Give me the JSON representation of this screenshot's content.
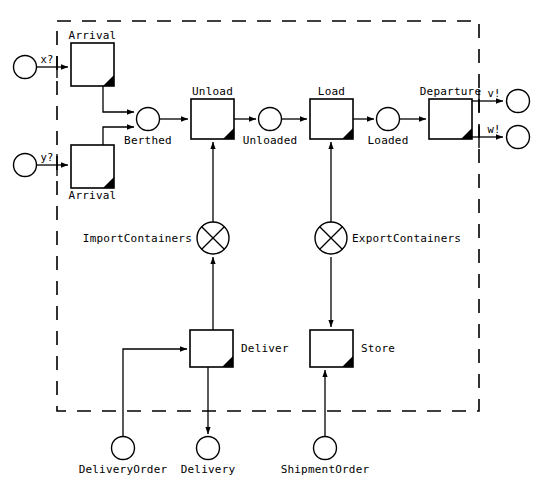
{
  "diagram": {
    "type": "petri-net-workflow",
    "boundary": {
      "style": "dashed",
      "label": ""
    },
    "colors": {
      "stroke": "#000000",
      "fill": "#ffffff",
      "corner_marker": "#000000"
    },
    "input_ports": [
      {
        "id": "x",
        "label": "x?",
        "place_label": ""
      },
      {
        "id": "y",
        "label": "y?",
        "place_label": ""
      }
    ],
    "output_ports": [
      {
        "id": "v",
        "label": "v!",
        "place_label": ""
      },
      {
        "id": "w",
        "label": "w!",
        "place_label": ""
      }
    ],
    "transitions": [
      {
        "id": "arrival_top",
        "label": "Arrival",
        "label_pos": "above"
      },
      {
        "id": "arrival_bottom",
        "label": "Arrival",
        "label_pos": "below"
      },
      {
        "id": "unload",
        "label": "Unload",
        "label_pos": "above"
      },
      {
        "id": "load",
        "label": "Load",
        "label_pos": "above"
      },
      {
        "id": "departure",
        "label": "Departure",
        "label_pos": "above"
      },
      {
        "id": "deliver",
        "label": "Deliver",
        "label_pos": "right"
      },
      {
        "id": "store",
        "label": "Store",
        "label_pos": "right"
      }
    ],
    "places": [
      {
        "id": "berthed",
        "label": "Berthed"
      },
      {
        "id": "unloaded",
        "label": "Unloaded"
      },
      {
        "id": "loaded",
        "label": "Loaded"
      },
      {
        "id": "delivery_order",
        "label": "DeliveryOrder"
      },
      {
        "id": "delivery",
        "label": "Delivery"
      },
      {
        "id": "shipment_order",
        "label": "ShipmentOrder"
      }
    ],
    "gates": [
      {
        "id": "import_containers",
        "label": "ImportContainers",
        "shape": "crossed-circle",
        "label_pos": "left"
      },
      {
        "id": "export_containers",
        "label": "ExportContainers",
        "shape": "crossed-circle",
        "label_pos": "right"
      }
    ]
  }
}
